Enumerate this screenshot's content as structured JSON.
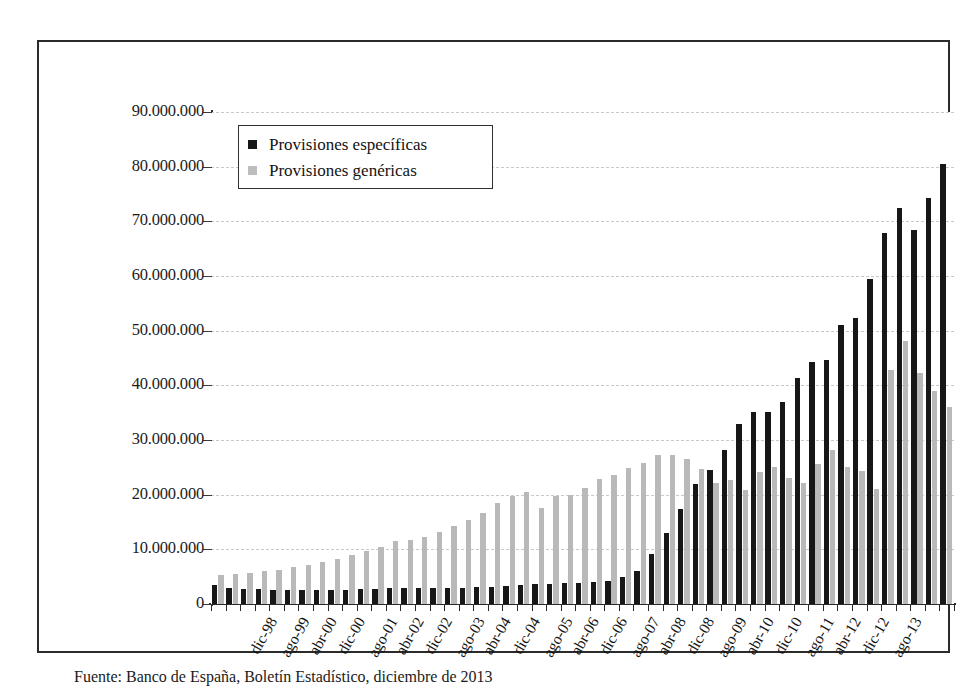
{
  "figure": {
    "caption": "Fuente: Banco de España, Boletín Estadístico, diciembre de 2013"
  },
  "legend": {
    "items": [
      {
        "label": "Provisiones específicas",
        "color": "#171717",
        "key": "specific"
      },
      {
        "label": "Provisiones genéricas",
        "color": "#bdbdbd",
        "key": "generic"
      }
    ]
  },
  "axes": {
    "y_ticks": [
      "0",
      "10.000.000",
      "20.000.000",
      "30.000.000",
      "40.000.000",
      "50.000.000",
      "60.000.000",
      "70.000.000",
      "80.000.000",
      "90.000.000"
    ]
  },
  "chart_data": {
    "type": "bar",
    "title": "",
    "subtitle": "",
    "xlabel": "",
    "ylabel": "",
    "ylim": [
      0,
      90000000
    ],
    "ytick_step": 10000000,
    "grid": true,
    "grid_style": "dashed-horizontal",
    "legend_position": "top-left-inside",
    "bar_mode": "grouped",
    "tick_label_rotation": -60,
    "tick_label_interval": 2,
    "categories": [
      "dic-98",
      "abr-99",
      "ago-99",
      "dic-99",
      "abr-00",
      "ago-00",
      "dic-00",
      "abr-01",
      "ago-01",
      "dic-01",
      "abr-02",
      "ago-02",
      "dic-02",
      "abr-03",
      "ago-03",
      "dic-03",
      "abr-04",
      "ago-04",
      "dic-04",
      "abr-05",
      "ago-05",
      "dic-05",
      "abr-06",
      "ago-06",
      "dic-06",
      "abr-07",
      "ago-07",
      "dic-07",
      "abr-08",
      "ago-08",
      "dic-08",
      "abr-09",
      "ago-09",
      "dic-09",
      "abr-10",
      "ago-10",
      "dic-10",
      "abr-11",
      "ago-11",
      "dic-11",
      "abr-12",
      "ago-12",
      "dic-12",
      "abr-13",
      "ago-13",
      "dic-13"
    ],
    "axis_tick_labels": [
      "dic-98",
      "ago-99",
      "abr-00",
      "dic-00",
      "ago-01",
      "abr-02",
      "dic-02",
      "ago-03",
      "abr-04",
      "dic-04",
      "ago-05",
      "abr-06",
      "dic-06",
      "ago-07",
      "abr-08",
      "dic-08",
      "ago-09",
      "abr-10",
      "dic-10",
      "ago-11",
      "abr-12",
      "dic-12",
      "ago-13"
    ],
    "series": [
      {
        "name": "Provisiones específicas",
        "color": "#171717",
        "values": [
          3400000,
          2900000,
          2800000,
          2700000,
          2600000,
          2500000,
          2500000,
          2500000,
          2500000,
          2600000,
          2700000,
          2800000,
          3000000,
          3000000,
          3000000,
          3000000,
          3000000,
          3000000,
          3100000,
          3200000,
          3300000,
          3400000,
          3600000,
          3700000,
          3800000,
          3900000,
          4000000,
          4300000,
          4900000,
          6100000,
          9100000,
          12900000,
          17400000,
          22000000,
          24500000,
          28200000,
          32900000,
          35100000,
          35100000,
          37000000,
          41300000,
          44300000,
          44700000,
          51000000,
          52300000,
          59400000
        ]
      },
      {
        "name": "Provisiones genéricas",
        "color": "#b9b9b9",
        "values": [
          5300000,
          5400000,
          5600000,
          6000000,
          6300000,
          6700000,
          7200000,
          7700000,
          8300000,
          9000000,
          9700000,
          10400000,
          11600000,
          11800000,
          12300000,
          13100000,
          14300000,
          15300000,
          16700000,
          18400000,
          19700000,
          20500000,
          17500000,
          19700000,
          20000000,
          21200000,
          22800000,
          23600000,
          24800000,
          25800000,
          27200000,
          27200000,
          26600000,
          24700000,
          22200000,
          22700000,
          20900000,
          24200000,
          25000000,
          23000000,
          22200000,
          25700000,
          28100000,
          25100000,
          24300000,
          21000000
        ]
      }
    ],
    "series_tail": [
      {
        "name": "Provisiones específicas",
        "values_tail": [
          67900000,
          72500000,
          68400000,
          74200000,
          80500000
        ]
      },
      {
        "name": "Provisiones genéricas",
        "values_tail": [
          42800000,
          48200000,
          42300000,
          39000000,
          36100000
        ]
      }
    ],
    "full_series": [
      {
        "name": "Provisiones específicas",
        "color": "#171717",
        "values": [
          3400000,
          2900000,
          2800000,
          2700000,
          2600000,
          2500000,
          2500000,
          2500000,
          2500000,
          2600000,
          2700000,
          2800000,
          3000000,
          3000000,
          3000000,
          3000000,
          3000000,
          3000000,
          3100000,
          3200000,
          3300000,
          3400000,
          3600000,
          3700000,
          3800000,
          3900000,
          4000000,
          4300000,
          4900000,
          6100000,
          9100000,
          12900000,
          17400000,
          22000000,
          24500000,
          28200000,
          32900000,
          35100000,
          35100000,
          37000000,
          41300000,
          44300000,
          44700000,
          51000000,
          52300000,
          59400000,
          67900000,
          72500000,
          68400000,
          74200000,
          80500000
        ]
      },
      {
        "name": "Provisiones genéricas",
        "color": "#b9b9b9",
        "values": [
          5300000,
          5400000,
          5600000,
          6000000,
          6300000,
          6700000,
          7200000,
          7700000,
          8300000,
          9000000,
          9700000,
          10400000,
          11600000,
          11800000,
          12300000,
          13100000,
          14300000,
          15300000,
          16700000,
          18400000,
          19700000,
          20500000,
          17500000,
          19700000,
          20000000,
          21200000,
          22800000,
          23600000,
          24800000,
          25800000,
          27200000,
          27200000,
          26600000,
          24700000,
          22200000,
          22700000,
          20900000,
          24200000,
          25000000,
          23000000,
          22200000,
          25700000,
          28100000,
          25100000,
          24300000,
          21000000,
          42800000,
          48200000,
          42300000,
          39000000,
          36100000
        ]
      }
    ]
  }
}
